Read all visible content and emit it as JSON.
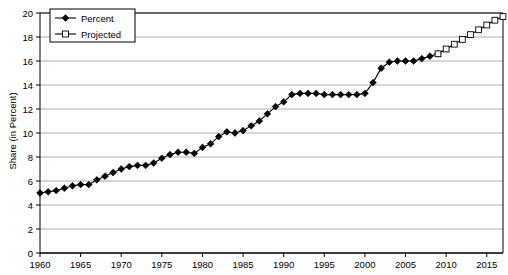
{
  "chart_data": {
    "type": "line",
    "title": "",
    "xlabel": "",
    "ylabel": "Share (in Percent)",
    "xlim": [
      1960,
      2017
    ],
    "ylim": [
      0,
      20
    ],
    "ytick_step": 2,
    "xtick_step": 5,
    "grid": true,
    "legend_position": "top-left",
    "yticks": [
      "0",
      "2",
      "4",
      "6",
      "8",
      "10",
      "12",
      "14",
      "16",
      "18",
      "20"
    ],
    "xticks": [
      "1960",
      "1965",
      "1970",
      "1975",
      "1980",
      "1985",
      "1990",
      "1995",
      "2000",
      "2005",
      "2010",
      "2015"
    ],
    "series": [
      {
        "name": "Percent",
        "marker": "filled-diamond",
        "color": "#000000",
        "x": [
          1960,
          1961,
          1962,
          1963,
          1964,
          1965,
          1966,
          1967,
          1968,
          1969,
          1970,
          1971,
          1972,
          1973,
          1974,
          1975,
          1976,
          1977,
          1978,
          1979,
          1980,
          1981,
          1982,
          1983,
          1984,
          1985,
          1986,
          1987,
          1988,
          1989,
          1990,
          1991,
          1992,
          1993,
          1994,
          1995,
          1996,
          1997,
          1998,
          1999,
          2000,
          2001,
          2002,
          2003,
          2004,
          2005,
          2006,
          2007,
          2008,
          2009
        ],
        "values": [
          5.0,
          5.1,
          5.2,
          5.4,
          5.6,
          5.7,
          5.7,
          6.1,
          6.4,
          6.7,
          7.0,
          7.2,
          7.3,
          7.3,
          7.5,
          7.9,
          8.2,
          8.4,
          8.4,
          8.3,
          8.8,
          9.1,
          9.7,
          10.1,
          10.0,
          10.2,
          10.6,
          11.0,
          11.6,
          12.2,
          12.6,
          13.2,
          13.3,
          13.3,
          13.3,
          13.2,
          13.2,
          13.2,
          13.2,
          13.2,
          13.3,
          14.2,
          15.4,
          15.9,
          16.0,
          16.0,
          16.0,
          16.2,
          16.4,
          16.6
        ]
      },
      {
        "name": "Projected",
        "marker": "open-square",
        "color": "#000000",
        "x": [
          2009,
          2010,
          2011,
          2012,
          2013,
          2014,
          2015,
          2016,
          2017
        ],
        "values": [
          16.6,
          17.0,
          17.4,
          17.8,
          18.2,
          18.6,
          19.0,
          19.4,
          19.7
        ]
      }
    ]
  },
  "legend": {
    "items": [
      {
        "label": "Percent",
        "marker": "filled-diamond"
      },
      {
        "label": "Projected",
        "marker": "open-square"
      }
    ]
  },
  "axis": {
    "ylabel": "Share (in Percent)"
  }
}
